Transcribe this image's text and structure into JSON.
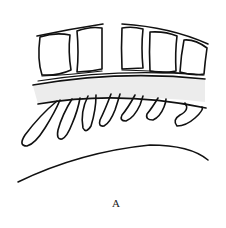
{
  "figure": {
    "type": "line-drawing",
    "label": "A",
    "colors": {
      "stroke": "#111111",
      "band_fill": "#ececec",
      "background": "#ffffff"
    },
    "parts": {
      "top_blocks_left_count": 2,
      "top_blocks_right_count": 3,
      "hanging_loops_count": 7
    }
  }
}
